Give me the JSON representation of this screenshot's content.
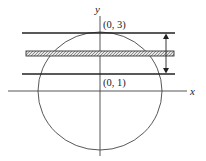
{
  "diagram": {
    "axes": {
      "x_label": "x",
      "y_label": "y"
    },
    "points": [
      {
        "label": "(0, 3)",
        "x": 0,
        "y": 3
      },
      {
        "label": "(0, 1)",
        "x": 0,
        "y": 1
      }
    ],
    "shapes": {
      "circle": "circle centered near origin passing through (0, 3)",
      "lines": [
        "horizontal line y = 3",
        "horizontal line y = 1"
      ],
      "strip": "hatched horizontal strip between the lines",
      "dimension_arrow": "double-headed vertical arrow between y = 1 and y = 3"
    }
  }
}
